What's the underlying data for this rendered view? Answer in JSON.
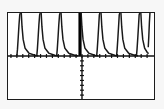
{
  "screen": {
    "title": "Graphing calculator plot screen",
    "width": 164,
    "height": 109,
    "background_color": "#f7f7f7",
    "frame_border_color": "#1c1c1c",
    "plot_background_color": "#ffffff"
  },
  "frame": {
    "label": "plot-viewport",
    "left": 7,
    "top": 12,
    "width": 148,
    "height": 88
  },
  "axes": {
    "color": "#111111",
    "x_axis_label": "x-axis",
    "y_axis_label": "y-axis",
    "x_axis_y_position": 44,
    "y_axis_x_position": 75,
    "tick_length": 4,
    "x_tick_spacing": 6,
    "y_tick_spacing": 5,
    "x_ticks_visible": true,
    "y_ticks_visible": true,
    "y_ticks_below_axis_only": true
  },
  "chart_data": {
    "type": "line",
    "title": "",
    "subtitle": "",
    "xlabel": "",
    "ylabel": "",
    "grid": false,
    "legend": [],
    "legend_position": "none",
    "xlim": [
      -3.8,
      3.8
    ],
    "ylim": [
      -2.2,
      2.2
    ],
    "x_axis_crossing_y": 0,
    "y_axis_crossing_x": 0,
    "period": 1.05,
    "asymptote_count": 7,
    "asymptotes_x": [
      -3.15,
      -2.1,
      -1.05,
      0,
      1.05,
      2.1,
      3.15
    ],
    "series": [
      {
        "name": "branch-1",
        "type": "line",
        "stroke": "#1a1a1a",
        "points": [
          {
            "x": -3.33,
            "y": 0.02
          },
          {
            "x": -3.3,
            "y": 0.35
          },
          {
            "x": -3.26,
            "y": 0.95
          },
          {
            "x": -3.22,
            "y": 1.6
          },
          {
            "x": -3.18,
            "y": 2.1
          },
          {
            "x": -3.15,
            "y": 2.2
          }
        ]
      },
      {
        "name": "branch-1-descent",
        "type": "line",
        "stroke": "#1a1a1a",
        "points": [
          {
            "x": -3.1,
            "y": 2.2
          },
          {
            "x": -3.06,
            "y": 1.5
          },
          {
            "x": -3.0,
            "y": 0.85
          },
          {
            "x": -2.9,
            "y": 0.4
          },
          {
            "x": -2.7,
            "y": 0.15
          },
          {
            "x": -2.35,
            "y": 0.03
          },
          {
            "x": -2.2,
            "y": 0.01
          }
        ]
      },
      {
        "name": "branch-2",
        "type": "line",
        "stroke": "#1a1a1a",
        "points": [
          {
            "x": -2.28,
            "y": 0.02
          },
          {
            "x": -2.25,
            "y": 0.35
          },
          {
            "x": -2.21,
            "y": 0.95
          },
          {
            "x": -2.17,
            "y": 1.6
          },
          {
            "x": -2.13,
            "y": 2.1
          },
          {
            "x": -2.1,
            "y": 2.2
          }
        ]
      },
      {
        "name": "branch-2-descent",
        "type": "line",
        "stroke": "#1a1a1a",
        "points": [
          {
            "x": -2.05,
            "y": 2.2
          },
          {
            "x": -2.01,
            "y": 1.5
          },
          {
            "x": -1.95,
            "y": 0.85
          },
          {
            "x": -1.85,
            "y": 0.4
          },
          {
            "x": -1.65,
            "y": 0.15
          },
          {
            "x": -1.3,
            "y": 0.03
          },
          {
            "x": -1.15,
            "y": 0.01
          }
        ]
      },
      {
        "name": "branch-3",
        "type": "line",
        "stroke": "#1a1a1a",
        "points": [
          {
            "x": -1.23,
            "y": 0.02
          },
          {
            "x": -1.2,
            "y": 0.35
          },
          {
            "x": -1.16,
            "y": 0.95
          },
          {
            "x": -1.12,
            "y": 1.6
          },
          {
            "x": -1.08,
            "y": 2.1
          },
          {
            "x": -1.05,
            "y": 2.2
          }
        ]
      },
      {
        "name": "branch-3-descent",
        "type": "line",
        "stroke": "#1a1a1a",
        "points": [
          {
            "x": -1.0,
            "y": 2.2
          },
          {
            "x": -0.96,
            "y": 1.5
          },
          {
            "x": -0.9,
            "y": 0.85
          },
          {
            "x": -0.8,
            "y": 0.4
          },
          {
            "x": -0.6,
            "y": 0.15
          },
          {
            "x": -0.25,
            "y": 0.03
          },
          {
            "x": -0.1,
            "y": 0.01
          }
        ]
      },
      {
        "name": "branch-center",
        "type": "line",
        "stroke": "#000000",
        "bold": true,
        "points": [
          {
            "x": 0,
            "y": 0.0
          },
          {
            "x": 0,
            "y": 2.2
          }
        ]
      },
      {
        "name": "branch-4-descent",
        "type": "line",
        "stroke": "#1a1a1a",
        "points": [
          {
            "x": 0.06,
            "y": 2.2
          },
          {
            "x": 0.1,
            "y": 1.5
          },
          {
            "x": 0.16,
            "y": 0.85
          },
          {
            "x": 0.26,
            "y": 0.4
          },
          {
            "x": 0.46,
            "y": 0.15
          },
          {
            "x": 0.81,
            "y": 0.03
          },
          {
            "x": 0.96,
            "y": 0.01
          }
        ]
      },
      {
        "name": "branch-4",
        "type": "line",
        "stroke": "#1a1a1a",
        "points": [
          {
            "x": 0.88,
            "y": 0.02
          },
          {
            "x": 0.91,
            "y": 0.35
          },
          {
            "x": 0.95,
            "y": 0.95
          },
          {
            "x": 0.99,
            "y": 1.6
          },
          {
            "x": 1.02,
            "y": 2.1
          },
          {
            "x": 1.05,
            "y": 2.2
          }
        ]
      },
      {
        "name": "branch-5-descent",
        "type": "line",
        "stroke": "#1a1a1a",
        "points": [
          {
            "x": 1.11,
            "y": 2.2
          },
          {
            "x": 1.15,
            "y": 1.5
          },
          {
            "x": 1.21,
            "y": 0.85
          },
          {
            "x": 1.31,
            "y": 0.4
          },
          {
            "x": 1.51,
            "y": 0.15
          },
          {
            "x": 1.86,
            "y": 0.03
          },
          {
            "x": 2.01,
            "y": 0.01
          }
        ]
      },
      {
        "name": "branch-5",
        "type": "line",
        "stroke": "#1a1a1a",
        "points": [
          {
            "x": 1.93,
            "y": 0.02
          },
          {
            "x": 1.96,
            "y": 0.35
          },
          {
            "x": 2.0,
            "y": 0.95
          },
          {
            "x": 2.04,
            "y": 1.6
          },
          {
            "x": 2.07,
            "y": 2.1
          },
          {
            "x": 2.1,
            "y": 2.2
          }
        ]
      },
      {
        "name": "branch-6-descent",
        "type": "line",
        "stroke": "#1a1a1a",
        "points": [
          {
            "x": 2.16,
            "y": 2.2
          },
          {
            "x": 2.2,
            "y": 1.5
          },
          {
            "x": 2.26,
            "y": 0.85
          },
          {
            "x": 2.36,
            "y": 0.4
          },
          {
            "x": 2.56,
            "y": 0.15
          },
          {
            "x": 2.91,
            "y": 0.03
          },
          {
            "x": 3.06,
            "y": 0.01
          }
        ]
      },
      {
        "name": "branch-6",
        "type": "line",
        "stroke": "#1a1a1a",
        "points": [
          {
            "x": 2.98,
            "y": 0.02
          },
          {
            "x": 3.01,
            "y": 0.35
          },
          {
            "x": 3.05,
            "y": 0.95
          },
          {
            "x": 3.09,
            "y": 1.6
          },
          {
            "x": 3.12,
            "y": 2.1
          },
          {
            "x": 3.15,
            "y": 2.2
          }
        ]
      },
      {
        "name": "branch-7-descent",
        "type": "line",
        "stroke": "#1a1a1a",
        "points": [
          {
            "x": 3.21,
            "y": 2.2
          },
          {
            "x": 3.25,
            "y": 1.5
          },
          {
            "x": 3.31,
            "y": 0.85
          },
          {
            "x": 3.41,
            "y": 0.4
          },
          {
            "x": 3.55,
            "y": 0.18
          },
          {
            "x": 3.62,
            "y": 0.12
          }
        ]
      },
      {
        "name": "branch-7",
        "type": "line",
        "stroke": "#1a1a1a",
        "points": [
          {
            "x": 3.6,
            "y": 0.45
          },
          {
            "x": 3.63,
            "y": 1.0
          },
          {
            "x": 3.66,
            "y": 1.7
          },
          {
            "x": 3.69,
            "y": 2.2
          }
        ]
      }
    ]
  }
}
